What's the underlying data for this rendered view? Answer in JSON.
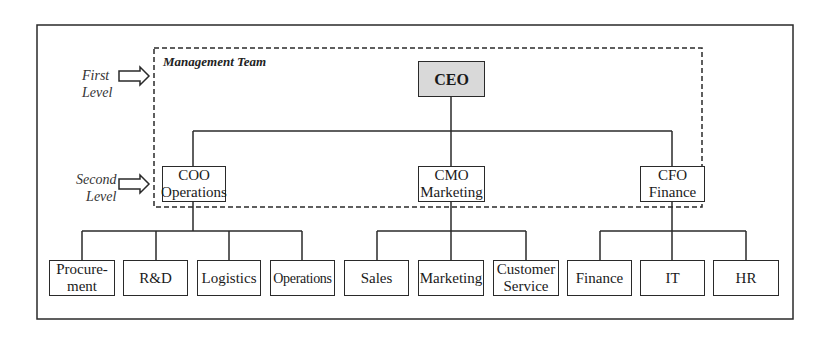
{
  "diagram": {
    "type": "org-chart",
    "group_label": "Management Team",
    "level_labels": [
      {
        "line1": "First",
        "line2": "Level"
      },
      {
        "line1": "Second",
        "line2": "Level"
      }
    ],
    "root": {
      "title": "CEO"
    },
    "executives": [
      {
        "title": "COO",
        "dept": "Operations",
        "children": [
          {
            "line1": "Procure-",
            "line2": "ment"
          },
          {
            "line1": "R&D",
            "line2": ""
          },
          {
            "line1": "Logistics",
            "line2": ""
          },
          {
            "line1": "Operations",
            "line2": ""
          }
        ]
      },
      {
        "title": "CMO",
        "dept": "Marketing",
        "children": [
          {
            "line1": "Sales",
            "line2": ""
          },
          {
            "line1": "Marketing",
            "line2": ""
          },
          {
            "line1": "Customer",
            "line2": "Service"
          }
        ]
      },
      {
        "title": "CFO",
        "dept": "Finance",
        "children": [
          {
            "line1": "Finance",
            "line2": ""
          },
          {
            "line1": "IT",
            "line2": ""
          },
          {
            "line1": "HR",
            "line2": ""
          }
        ]
      }
    ],
    "colors": {
      "ceo_fill": "#d9d9d9",
      "line": "#2a2a2a"
    }
  }
}
